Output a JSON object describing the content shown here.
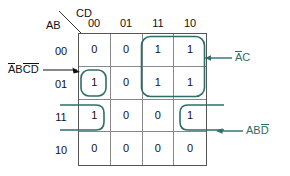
{
  "diagram": {
    "type": "karnaugh-map",
    "axis": {
      "column_variable": "CD",
      "row_variable": "AB",
      "column_headers": [
        "00",
        "01",
        "11",
        "10"
      ],
      "row_headers": [
        "00",
        "01",
        "11",
        "10"
      ]
    },
    "cells": [
      [
        "0",
        "0",
        "1",
        "1"
      ],
      [
        "1",
        "0",
        "1",
        "1"
      ],
      [
        "1",
        "0",
        "0",
        "1"
      ],
      [
        "0",
        "0",
        "0",
        "0"
      ]
    ],
    "groups": [
      {
        "id": "group-ac",
        "label_parts": [
          {
            "text": "A",
            "overbar": true
          },
          {
            "text": "C",
            "overbar": false
          }
        ],
        "label_plain": "AC",
        "cells": "rows 00-01, columns 11-10",
        "color": "#2d6e68"
      },
      {
        "id": "group-abcd",
        "label_parts": [
          {
            "text": "A",
            "overbar": true
          },
          {
            "text": "B",
            "overbar": false
          },
          {
            "text": "C",
            "overbar": true
          },
          {
            "text": "D",
            "overbar": true
          }
        ],
        "label_plain": "ABCD",
        "cells": "row 01, column 00",
        "color": "#2d6e68"
      },
      {
        "id": "group-abd",
        "label_parts": [
          {
            "text": "A",
            "overbar": false
          },
          {
            "text": "B",
            "overbar": false
          },
          {
            "text": "D",
            "overbar": true
          }
        ],
        "label_plain": "ABD",
        "cells": "row 11, columns 00 and 10 (wrap-around)",
        "color": "#2d6e68"
      }
    ],
    "colors": {
      "group_outline": "#2d6e68",
      "grid_inner": "#888888",
      "grid_outer": "#555555",
      "text": "#111111",
      "arrow_dark": "#111111",
      "background": "#ffffff"
    }
  }
}
